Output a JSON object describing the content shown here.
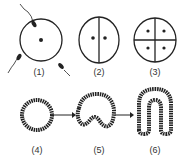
{
  "stages": [
    {
      "label": "(1)",
      "name": "fertilization"
    },
    {
      "label": "(2)",
      "name": "two-cell stage"
    },
    {
      "label": "(3)",
      "name": "four-cell stage"
    },
    {
      "label": "(4)",
      "name": "blastula"
    },
    {
      "label": "(5)",
      "name": "early gastrula"
    },
    {
      "label": "(6)",
      "name": "gastrula"
    }
  ]
}
